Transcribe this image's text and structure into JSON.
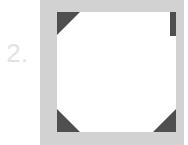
{
  "step": {
    "number": "2."
  },
  "illustration": {
    "icon": "photo-corner-mount-icon",
    "frame_color": "#d2d2d2",
    "photo_color": "#ffffff",
    "corner_color": "#4f4f4f"
  }
}
